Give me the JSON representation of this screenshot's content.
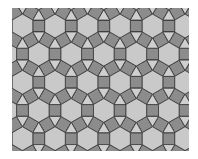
{
  "figure": {
    "kind": "rhombitrihexagonal-tiling",
    "canvas": {
      "width": 198,
      "height": 159,
      "background": "#ffffff"
    },
    "clip": {
      "x": 12,
      "y": 8,
      "width": 177,
      "height": 143
    },
    "edge_length": 11.9,
    "origin": {
      "x": 22.5,
      "y": 26
    },
    "rows": 7,
    "cols": 7,
    "colors": {
      "hexagon": "#c9c9c9",
      "square": "#8c8c8c",
      "triangle": "#cfcfcf",
      "stroke": "#3a3a3a"
    },
    "stroke_width": 0.8
  }
}
